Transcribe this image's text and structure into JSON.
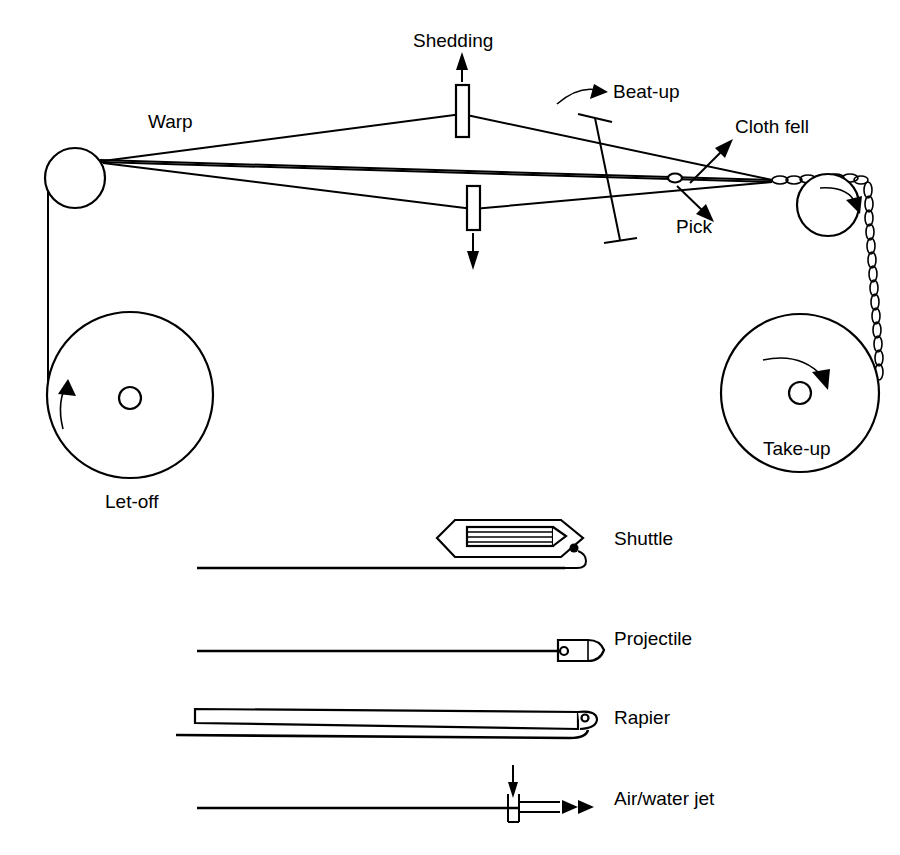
{
  "figure": {
    "kind": "weaving-loom-schematic",
    "background_color": "#ffffff",
    "line_color": "#000000",
    "width": 900,
    "height": 855
  },
  "loom": {
    "labels": {
      "warp": "Warp",
      "shedding": "Shedding",
      "beat_up": "Beat-up",
      "cloth_fell": "Cloth fell",
      "pick": "Pick",
      "let_off": "Let-off",
      "take_up": "Take-up"
    },
    "label_positions": {
      "warp": {
        "x": 148,
        "y": 128
      },
      "shedding": {
        "x": 413,
        "y": 47
      },
      "beat_up": {
        "x": 613,
        "y": 98
      },
      "cloth_fell": {
        "x": 735,
        "y": 133
      },
      "pick": {
        "x": 676,
        "y": 233
      },
      "let_off": {
        "x": 105,
        "y": 508
      },
      "take_up": {
        "x": 763,
        "y": 455
      }
    },
    "components": [
      {
        "name": "back-rest-roller",
        "type": "circle",
        "cx": 75,
        "cy": 178,
        "r": 30
      },
      {
        "name": "let-off-beam",
        "type": "circle",
        "cx": 130,
        "cy": 395,
        "r": 83
      },
      {
        "name": "let-off-beam-core",
        "type": "circle",
        "cx": 130,
        "cy": 398,
        "r": 11
      },
      {
        "name": "front-rest-roller",
        "type": "circle",
        "cx": 828,
        "cy": 205,
        "r": 31
      },
      {
        "name": "take-up-beam",
        "type": "circle",
        "cx": 800,
        "cy": 393,
        "r": 79
      },
      {
        "name": "take-up-beam-core",
        "type": "circle",
        "cx": 800,
        "cy": 393,
        "r": 11
      },
      {
        "name": "heddle-frame-upper",
        "type": "rect",
        "x": 456,
        "y": 85,
        "w": 13,
        "h": 52
      },
      {
        "name": "heddle-frame-lower",
        "type": "rect",
        "x": 467,
        "y": 186,
        "w": 13,
        "h": 44
      },
      {
        "name": "reed",
        "type": "slanted-bar"
      },
      {
        "name": "pick-marker",
        "type": "ellipse",
        "cx": 675,
        "cy": 178,
        "rx": 6,
        "ry": 4
      }
    ],
    "arrows": {
      "shedding_up": "up",
      "shedding_down": "down",
      "beat_up": "curved-right",
      "cloth_fell": "up-right",
      "pick": "down-right",
      "let_off_rotation": "counter-clockwise",
      "take_up_roller_rotation": "clockwise",
      "take_up_beam_rotation": "clockwise"
    }
  },
  "insertion_devices": {
    "items": [
      {
        "label": "Shuttle",
        "label_x": 614,
        "label_y": 545,
        "weft_y": 568
      },
      {
        "label": "Projectile",
        "label_x": 614,
        "label_y": 645,
        "weft_y": 651
      },
      {
        "label": "Rapier",
        "label_x": 614,
        "label_y": 724,
        "weft_y": 735
      },
      {
        "label": "Air/water jet",
        "label_x": 614,
        "label_y": 805,
        "weft_y": 808
      }
    ]
  }
}
